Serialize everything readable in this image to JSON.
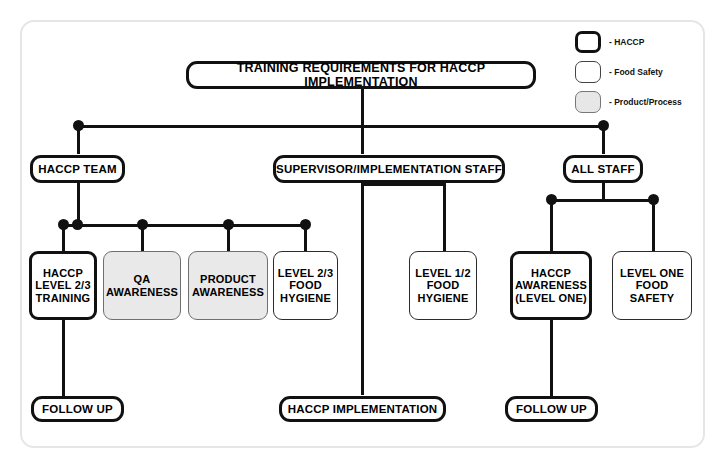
{
  "diagram": {
    "title_node": {
      "label": "TRAINING REQUIREMENTS FOR HACCP IMPLEMENTATION",
      "type": "haccp"
    },
    "legend": {
      "items": [
        {
          "swatch": "haccp",
          "label": "- HACCP"
        },
        {
          "swatch": "food",
          "label": "- Food Safety"
        },
        {
          "swatch": "product",
          "label": "- Product/Process"
        }
      ]
    },
    "level2": [
      {
        "label": "HACCP TEAM",
        "type": "haccp"
      },
      {
        "label": "SUPERVISOR/IMPLEMENTATION STAFF",
        "type": "haccp"
      },
      {
        "label": "ALL STAFF",
        "type": "haccp"
      }
    ],
    "level3": [
      {
        "label": "HACCP\nLEVEL 2/3\nTRAINING",
        "type": "haccp"
      },
      {
        "label": "QA\nAWARENESS",
        "type": "product"
      },
      {
        "label": "PRODUCT\nAWARENESS",
        "type": "product"
      },
      {
        "label": "LEVEL 2/3\nFOOD\nHYGIENE",
        "type": "food"
      },
      {
        "label": "LEVEL 1/2\nFOOD\nHYGIENE",
        "type": "food"
      },
      {
        "label": "HACCP\nAWARENESS\n(LEVEL ONE)",
        "type": "haccp"
      },
      {
        "label": "LEVEL ONE\nFOOD\nSAFETY",
        "type": "food"
      }
    ],
    "level4": [
      {
        "label": "FOLLOW UP",
        "type": "haccp"
      },
      {
        "label": "HACCP IMPLEMENTATION",
        "type": "haccp"
      },
      {
        "label": "FOLLOW UP",
        "type": "haccp"
      }
    ],
    "colors": {
      "line": "#111111",
      "haccp_border": "#111111",
      "food_border": "#2b2b2b",
      "product_fill": "#e9e9e9",
      "frame_border": "#e6e6e6",
      "background": "#ffffff"
    }
  }
}
